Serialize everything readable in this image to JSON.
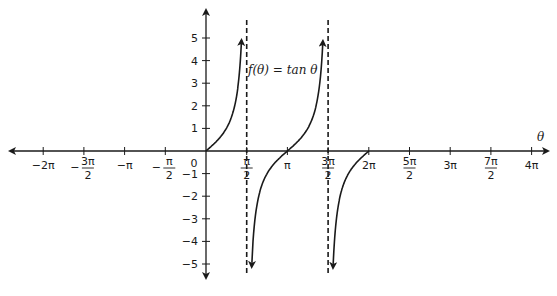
{
  "chart_data": {
    "type": "line",
    "title": "",
    "function_label": "f(θ) = tan θ",
    "xlabel": "θ",
    "ylabel": "",
    "xlim": [
      -6.283,
      12.566
    ],
    "ylim": [
      -5.3,
      5.3
    ],
    "grid": false,
    "x_ticks": [
      {
        "value": -6.2832,
        "label": "−2π"
      },
      {
        "value": -4.7124,
        "label": "−3π/2"
      },
      {
        "value": -3.1416,
        "label": "−π"
      },
      {
        "value": -1.5708,
        "label": "−π/2"
      },
      {
        "value": 0,
        "label": "0"
      },
      {
        "value": 1.5708,
        "label": "π/2"
      },
      {
        "value": 3.1416,
        "label": "π"
      },
      {
        "value": 4.7124,
        "label": "3π/2"
      },
      {
        "value": 6.2832,
        "label": "2π"
      },
      {
        "value": 7.854,
        "label": "5π/2"
      },
      {
        "value": 9.4248,
        "label": "3π"
      },
      {
        "value": 10.9956,
        "label": "7π/2"
      },
      {
        "value": 12.5664,
        "label": "4π"
      }
    ],
    "y_ticks": [
      -5,
      -4,
      -3,
      -2,
      -1,
      1,
      2,
      3,
      4,
      5
    ],
    "asymptotes": [
      1.5708,
      4.7124
    ],
    "series": [
      {
        "name": "tan θ branch 1",
        "domain": [
          0,
          1.37
        ],
        "description": "from (0,0) rising to +5.3 near π/2"
      },
      {
        "name": "tan θ branch 2",
        "domain": [
          1.77,
          4.51
        ],
        "description": "from −5.3 near π/2 through (π,0) to +5.3 near 3π/2"
      },
      {
        "name": "tan θ branch 3",
        "domain": [
          4.91,
          6.2832
        ],
        "description": "from −5.3 near 3π/2 rising to (2π,0)"
      }
    ],
    "colors": {
      "curve": "#1a1a1a",
      "axes": "#1a1a1a",
      "asymptote": "#1a1a1a"
    }
  }
}
